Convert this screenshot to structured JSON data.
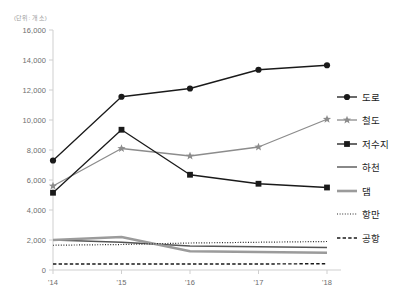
{
  "chart_data": {
    "type": "line",
    "title": "",
    "unit_label": "(단위: 개소)",
    "xlabel": "",
    "ylabel": "",
    "categories": [
      "'14",
      "'15",
      "'16",
      "'17",
      "'18"
    ],
    "ylim": [
      0,
      16000
    ],
    "ytick_values": [
      0,
      2000,
      4000,
      6000,
      8000,
      10000,
      12000,
      14000,
      16000
    ],
    "ytick_labels": [
      "0",
      "2,000",
      "4,000",
      "6,000",
      "8,000",
      "10,000",
      "12,000",
      "14,000",
      "16,000"
    ],
    "grid": false,
    "legend_position": "right",
    "series": [
      {
        "name": "도로",
        "values": [
          7300,
          11550,
          12100,
          13350,
          13650
        ],
        "color": "#1a1a1a",
        "marker": "circle",
        "line_style": "solid",
        "line_width": 1.3
      },
      {
        "name": "철도",
        "values": [
          5600,
          8100,
          7600,
          8200,
          10050
        ],
        "color": "#8c8c8c",
        "marker": "star",
        "line_style": "solid",
        "line_width": 1.3
      },
      {
        "name": "저수지",
        "values": [
          5150,
          9350,
          6350,
          5750,
          5500
        ],
        "color": "#1a1a1a",
        "marker": "square",
        "line_style": "solid",
        "line_width": 1.3
      },
      {
        "name": "하천",
        "values": [
          2000,
          1850,
          1600,
          1550,
          1500
        ],
        "color": "#555555",
        "marker": "none",
        "line_style": "solid",
        "line_width": 1.4
      },
      {
        "name": "댐",
        "values": [
          2000,
          2200,
          1250,
          1200,
          1150
        ],
        "color": "#9b9b9b",
        "marker": "none",
        "line_style": "solid",
        "line_width": 2.6
      },
      {
        "name": "항만",
        "values": [
          1650,
          1700,
          1800,
          1850,
          1900
        ],
        "color": "#2b2b2b",
        "marker": "none",
        "line_style": "dotted",
        "line_width": 1.2
      },
      {
        "name": "공항",
        "values": [
          400,
          400,
          400,
          400,
          420
        ],
        "color": "#1a1a1a",
        "marker": "none",
        "line_style": "dashed",
        "line_width": 1.4
      }
    ]
  },
  "legend": {
    "items": [
      {
        "label": "도로",
        "marker": "circle-line-marker"
      },
      {
        "label": "철도",
        "marker": "star-line-marker"
      },
      {
        "label": "저수지",
        "marker": "square-line-marker"
      },
      {
        "label": "하천",
        "marker": "solid-line-marker"
      },
      {
        "label": "댐",
        "marker": "thick-gray-line-marker"
      },
      {
        "label": "항만",
        "marker": "dotted-line-marker"
      },
      {
        "label": "공항",
        "marker": "dashed-line-marker"
      }
    ]
  },
  "axes": {
    "axis_color": "#cfcfcf",
    "tick_color": "#cfcfcf",
    "label_color": "#6e6e6e"
  }
}
